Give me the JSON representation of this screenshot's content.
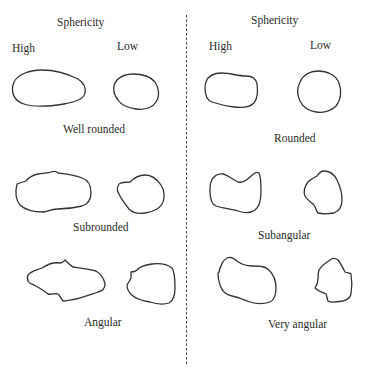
{
  "diagram": {
    "left_panel": {
      "header": "Sphericity",
      "high_label": "High",
      "low_label": "Low",
      "classes": [
        {
          "label": "Well rounded"
        },
        {
          "label": "Subrounded"
        },
        {
          "label": "Angular"
        }
      ]
    },
    "right_panel": {
      "header": "Sphericity",
      "high_label": "High",
      "low_label": "Low",
      "classes": [
        {
          "label": "Rounded"
        },
        {
          "label": "Subangular"
        },
        {
          "label": "Very angular"
        }
      ]
    },
    "colors": {
      "stroke": "#333333",
      "divider": "#444444",
      "background": "#ffffff"
    }
  }
}
